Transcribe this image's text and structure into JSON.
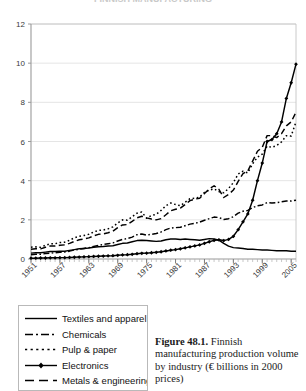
{
  "figure": {
    "clipped_top_title": "FINNISH MANUFACTURING",
    "caption_label": "Figure 48.1.",
    "caption_text": " Finnish manufacturing production volume by industry (€ billions in 2000 prices)"
  },
  "legend": {
    "items": [
      {
        "label": "Textiles and apparel",
        "style": "solid",
        "marker": "none",
        "color": "#000000"
      },
      {
        "label": "Chemicals",
        "style": "dash-dot",
        "marker": "none",
        "color": "#000000"
      },
      {
        "label": "Pulp & paper",
        "style": "dotted",
        "marker": "none",
        "color": "#000000"
      },
      {
        "label": "Electronics",
        "style": "solid-marker",
        "marker": "diamond",
        "color": "#000000"
      },
      {
        "label": "Metals & engineering",
        "style": "dashed",
        "marker": "none",
        "color": "#000000"
      }
    ]
  },
  "chart_data": {
    "type": "line",
    "title": "",
    "xlabel": "",
    "ylabel": "",
    "ylim": [
      0,
      12
    ],
    "yticks": [
      0,
      2,
      4,
      6,
      8,
      10,
      12
    ],
    "xlim": [
      1951,
      2006
    ],
    "xticks": [
      1951,
      1957,
      1963,
      1969,
      1975,
      1981,
      1987,
      1993,
      1999,
      2005
    ],
    "xtick_rotation_deg": -45,
    "grid": "horizontal",
    "legend_position": "below-left",
    "units": "€ billions in 2000 prices",
    "x": [
      1951,
      1952,
      1953,
      1954,
      1955,
      1956,
      1957,
      1958,
      1959,
      1960,
      1961,
      1962,
      1963,
      1964,
      1965,
      1966,
      1967,
      1968,
      1969,
      1970,
      1971,
      1972,
      1973,
      1974,
      1975,
      1976,
      1977,
      1978,
      1979,
      1980,
      1981,
      1982,
      1983,
      1984,
      1985,
      1986,
      1987,
      1988,
      1989,
      1990,
      1991,
      1992,
      1993,
      1994,
      1995,
      1996,
      1997,
      1998,
      1999,
      2000,
      2001,
      2002,
      2003,
      2004,
      2005,
      2006
    ],
    "series": [
      {
        "name": "Textiles and apparel",
        "style": "solid",
        "values": [
          0.3,
          0.32,
          0.32,
          0.35,
          0.38,
          0.38,
          0.4,
          0.4,
          0.44,
          0.48,
          0.52,
          0.54,
          0.56,
          0.6,
          0.63,
          0.64,
          0.66,
          0.68,
          0.74,
          0.8,
          0.82,
          0.88,
          0.94,
          0.96,
          0.94,
          0.92,
          0.9,
          0.92,
          0.98,
          1.02,
          1.02,
          1.0,
          1.02,
          1.0,
          0.98,
          0.96,
          1.0,
          1.04,
          1.02,
          0.96,
          0.8,
          0.66,
          0.58,
          0.56,
          0.54,
          0.5,
          0.5,
          0.48,
          0.46,
          0.46,
          0.44,
          0.42,
          0.42,
          0.42,
          0.4,
          0.4
        ]
      },
      {
        "name": "Chemicals",
        "style": "dash-dot",
        "values": [
          0.22,
          0.24,
          0.24,
          0.28,
          0.3,
          0.32,
          0.34,
          0.36,
          0.4,
          0.46,
          0.5,
          0.54,
          0.58,
          0.64,
          0.7,
          0.74,
          0.78,
          0.82,
          0.92,
          1.0,
          1.04,
          1.12,
          1.24,
          1.28,
          1.22,
          1.26,
          1.3,
          1.38,
          1.5,
          1.58,
          1.6,
          1.62,
          1.7,
          1.78,
          1.82,
          1.88,
          1.98,
          2.06,
          2.14,
          2.12,
          2.02,
          2.06,
          2.16,
          2.34,
          2.44,
          2.48,
          2.62,
          2.72,
          2.76,
          2.88,
          2.86,
          2.88,
          2.92,
          2.96,
          2.96,
          3.0
        ]
      },
      {
        "name": "Pulp & paper",
        "style": "dotted",
        "values": [
          0.6,
          0.62,
          0.6,
          0.7,
          0.78,
          0.78,
          0.84,
          0.86,
          0.96,
          1.08,
          1.16,
          1.2,
          1.26,
          1.38,
          1.46,
          1.48,
          1.54,
          1.64,
          1.84,
          2.0,
          1.98,
          2.16,
          2.34,
          2.4,
          2.08,
          2.22,
          2.28,
          2.48,
          2.72,
          2.86,
          2.78,
          2.72,
          2.9,
          3.08,
          3.1,
          3.16,
          3.4,
          3.52,
          3.58,
          3.44,
          3.38,
          3.6,
          3.9,
          4.34,
          4.48,
          4.4,
          4.86,
          5.2,
          5.36,
          5.76,
          5.7,
          5.8,
          5.98,
          6.3,
          6.28,
          7.0
        ]
      },
      {
        "name": "Electronics",
        "style": "solid-marker",
        "marker": "diamond",
        "values": [
          0.04,
          0.04,
          0.05,
          0.05,
          0.06,
          0.06,
          0.07,
          0.07,
          0.08,
          0.09,
          0.1,
          0.11,
          0.12,
          0.13,
          0.14,
          0.15,
          0.16,
          0.17,
          0.19,
          0.21,
          0.22,
          0.24,
          0.27,
          0.29,
          0.3,
          0.32,
          0.34,
          0.37,
          0.41,
          0.45,
          0.48,
          0.52,
          0.57,
          0.62,
          0.67,
          0.72,
          0.8,
          0.88,
          0.95,
          0.98,
          0.94,
          1.0,
          1.16,
          1.5,
          1.9,
          2.3,
          3.0,
          4.0,
          4.9,
          6.0,
          6.1,
          6.4,
          7.0,
          8.2,
          9.0,
          9.95
        ]
      },
      {
        "name": "Metals & engineering",
        "style": "dashed",
        "values": [
          0.5,
          0.52,
          0.52,
          0.6,
          0.66,
          0.66,
          0.7,
          0.72,
          0.8,
          0.9,
          0.98,
          1.02,
          1.08,
          1.18,
          1.26,
          1.28,
          1.34,
          1.42,
          1.6,
          1.74,
          1.76,
          1.92,
          2.1,
          2.18,
          2.1,
          2.04,
          2.0,
          2.06,
          2.26,
          2.46,
          2.54,
          2.6,
          2.78,
          2.98,
          3.06,
          3.1,
          3.34,
          3.58,
          3.74,
          3.56,
          3.14,
          3.3,
          3.52,
          3.96,
          4.36,
          4.5,
          5.0,
          5.5,
          5.7,
          6.3,
          6.3,
          6.2,
          6.4,
          6.8,
          7.0,
          7.5
        ]
      }
    ]
  }
}
